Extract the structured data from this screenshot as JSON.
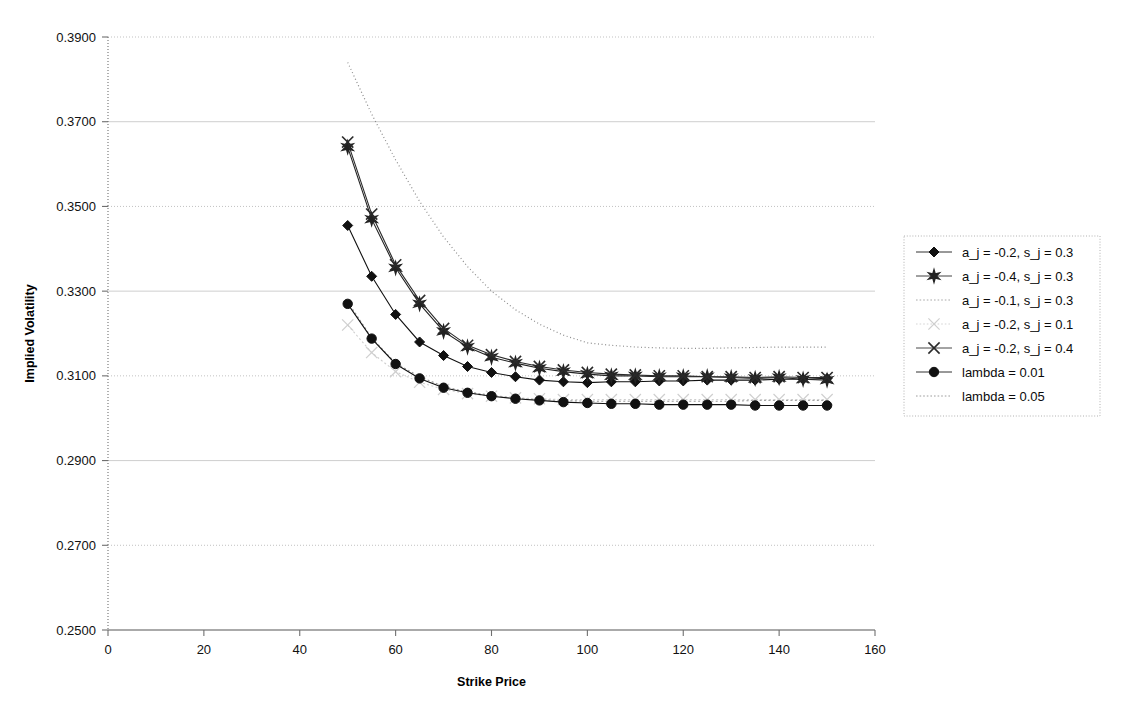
{
  "chart_data": {
    "type": "line",
    "title": "",
    "xlabel": "Strike Price",
    "ylabel": "Implied Volatility",
    "xlim": [
      0,
      160
    ],
    "ylim": [
      0.25,
      0.39
    ],
    "xticks": [
      "0",
      "20",
      "40",
      "60",
      "80",
      "100",
      "120",
      "140",
      "160"
    ],
    "yticks": [
      "0.2500",
      "0.2700",
      "0.2900",
      "0.3100",
      "0.3300",
      "0.3500",
      "0.3700",
      "0.3900"
    ],
    "xtick_values": [
      0,
      20,
      40,
      60,
      80,
      100,
      120,
      140,
      160
    ],
    "ytick_values": [
      0.25,
      0.27,
      0.29,
      0.31,
      0.33,
      0.35,
      0.37,
      0.39
    ],
    "grid": "horizontal",
    "legend_position": "right",
    "x": [
      50,
      55,
      60,
      65,
      70,
      75,
      80,
      85,
      90,
      95,
      100,
      105,
      110,
      115,
      120,
      125,
      130,
      135,
      140,
      145,
      150
    ],
    "series": [
      {
        "name": "a_j = -0.2, s_j = 0.3",
        "marker": "diamond",
        "color": "#111111",
        "values": [
          0.3455,
          0.3335,
          0.3245,
          0.318,
          0.3148,
          0.3122,
          0.3108,
          0.3098,
          0.309,
          0.3086,
          0.3084,
          0.3086,
          0.3086,
          0.3088,
          0.3088,
          0.309,
          0.309,
          0.309,
          0.3092,
          0.3092,
          0.3094
        ]
      },
      {
        "name": "a_j = -0.4, s_j = 0.3",
        "marker": "star",
        "color": "#222222",
        "values": [
          0.364,
          0.347,
          0.3355,
          0.327,
          0.3205,
          0.3168,
          0.3144,
          0.313,
          0.3118,
          0.311,
          0.3104,
          0.31,
          0.31,
          0.3098,
          0.3098,
          0.3098,
          0.3096,
          0.3094,
          0.3096,
          0.3092,
          0.309
        ]
      },
      {
        "name": "a_j = -0.1, s_j = 0.3",
        "marker": "none",
        "color": "#9a9a9a",
        "values": [
          0.3275,
          0.319,
          0.313,
          0.3098,
          0.3075,
          0.3062,
          0.3054,
          0.3048,
          0.3044,
          0.3042,
          0.304,
          0.304,
          0.304,
          0.304,
          0.304,
          0.304,
          0.304,
          0.3042,
          0.3042,
          0.3042,
          0.3042
        ]
      },
      {
        "name": "a_j = -0.2, s_j = 0.1",
        "marker": "x-light",
        "color": "#cfcfcf",
        "values": [
          0.322,
          0.3155,
          0.311,
          0.3085,
          0.3068,
          0.3058,
          0.3052,
          0.3048,
          0.3046,
          0.3044,
          0.3044,
          0.3044,
          0.3044,
          0.3044,
          0.3044,
          0.3044,
          0.3044,
          0.3044,
          0.3044,
          0.3044,
          0.3044
        ]
      },
      {
        "name": "a_j = -0.2, s_j = 0.4",
        "marker": "x",
        "color": "#2a2a2a",
        "values": [
          0.3652,
          0.3482,
          0.3362,
          0.3278,
          0.3212,
          0.3172,
          0.315,
          0.3134,
          0.3122,
          0.3114,
          0.3108,
          0.3104,
          0.3102,
          0.31,
          0.31,
          0.3098,
          0.3098,
          0.3096,
          0.3098,
          0.3096,
          0.3096
        ]
      },
      {
        "name": "lambda = 0.01",
        "marker": "circle",
        "color": "#111111",
        "values": [
          0.327,
          0.3188,
          0.3128,
          0.3094,
          0.3072,
          0.306,
          0.3052,
          0.3046,
          0.3042,
          0.3038,
          0.3036,
          0.3034,
          0.3034,
          0.3032,
          0.3032,
          0.3032,
          0.3032,
          0.303,
          0.303,
          0.303,
          0.303
        ]
      },
      {
        "name": "lambda = 0.05",
        "marker": "none-dotted",
        "color": "#8c8c8c",
        "values": [
          0.384,
          0.3718,
          0.361,
          0.3512,
          0.3428,
          0.3358,
          0.33,
          0.3256,
          0.3222,
          0.3196,
          0.3178,
          0.3172,
          0.3168,
          0.3166,
          0.3165,
          0.3165,
          0.3166,
          0.3167,
          0.3168,
          0.3168,
          0.3168
        ]
      }
    ]
  },
  "axes": {
    "x_title": "Strike Price",
    "y_title": "Implied Volatility"
  },
  "legend": {
    "items": [
      {
        "label": "a_j = -0.2, s_j = 0.3",
        "marker": "diamond"
      },
      {
        "label": "a_j = -0.4, s_j = 0.3",
        "marker": "star"
      },
      {
        "label": "a_j = -0.1, s_j = 0.3",
        "marker": "none"
      },
      {
        "label": "a_j = -0.2, s_j = 0.1",
        "marker": "x-light"
      },
      {
        "label": "a_j = -0.2, s_j = 0.4",
        "marker": "x"
      },
      {
        "label": "lambda = 0.01",
        "marker": "circle"
      },
      {
        "label": "lambda = 0.05",
        "marker": "none-dotted"
      }
    ]
  },
  "colors": {
    "axis": "#6f6f6f",
    "grid": "#b8b8b8",
    "text": "#111111",
    "legend_border": "#b0b0b0"
  }
}
